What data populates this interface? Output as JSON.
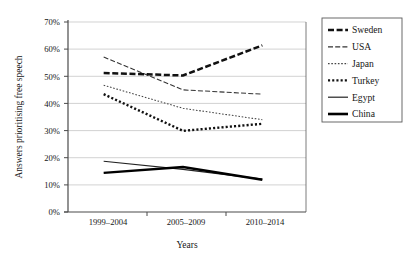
{
  "chart_data": {
    "type": "line",
    "title": "",
    "xlabel": "Years",
    "ylabel": "Answers prioritising free speech",
    "categories": [
      "1999–2004",
      "2005–2009",
      "2010–2014"
    ],
    "ylim": [
      0,
      70
    ],
    "ytick_labels": [
      "0%",
      "10%",
      "20%",
      "30%",
      "40%",
      "50%",
      "60%",
      "70%"
    ],
    "ytick_values": [
      0,
      10,
      20,
      30,
      40,
      50,
      60,
      70
    ],
    "grid": "horizontal",
    "legend_position": "right",
    "series": [
      {
        "name": "Sweden",
        "values": [
          51.2,
          50.3,
          61.4
        ],
        "style": "dashed",
        "width": "thick",
        "color": "#111111"
      },
      {
        "name": "USA",
        "values": [
          57.1,
          45.0,
          43.4
        ],
        "style": "dashed",
        "width": "thin",
        "color": "#333333"
      },
      {
        "name": "Japan",
        "values": [
          46.7,
          38.2,
          34.0
        ],
        "style": "fine-dotted",
        "width": "thin",
        "color": "#444444"
      },
      {
        "name": "Turkey",
        "values": [
          43.4,
          29.9,
          32.5
        ],
        "style": "dotted",
        "width": "thick",
        "color": "#111111"
      },
      {
        "name": "Egypt",
        "values": [
          18.7,
          15.7,
          12.1
        ],
        "style": "solid",
        "width": "thin",
        "color": "#222222"
      },
      {
        "name": "China",
        "values": [
          14.4,
          16.6,
          11.9
        ],
        "style": "solid",
        "width": "thick",
        "color": "#000000"
      }
    ]
  },
  "legend": {
    "items": [
      {
        "label": "Sweden"
      },
      {
        "label": "USA"
      },
      {
        "label": "Japan"
      },
      {
        "label": "Turkey"
      },
      {
        "label": "Egypt"
      },
      {
        "label": "China"
      }
    ]
  }
}
